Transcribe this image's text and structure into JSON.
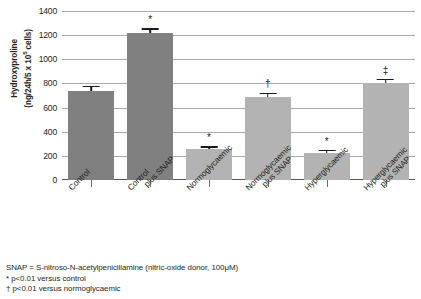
{
  "chart_data": {
    "type": "bar",
    "title": "",
    "xlabel": "",
    "ylabel": "Hydroxyproline (ng/24h/5 x 10⁵ cells)",
    "ylabel_line1": "Hydroxyproline",
    "ylabel_line2_pre": "(ng/24h/5 x 10",
    "ylabel_line2_sup": "5",
    "ylabel_line2_post": " cells)",
    "ylim": [
      0,
      1400
    ],
    "ytick_step": 200,
    "yticks": [
      "1400",
      "1200",
      "1000",
      "800",
      "600",
      "400",
      "200",
      "0"
    ],
    "ytick_values": [
      1400,
      1200,
      1000,
      800,
      600,
      400,
      200,
      0
    ],
    "grid": true,
    "legend": "none",
    "categories": [
      "Control",
      "Control plus SNAP",
      "Normoglycaemic",
      "Normoglycaemic plus SNAP",
      "Hyperglycaemic",
      "Hyperglycaemic plus SNAP"
    ],
    "category_lines": [
      [
        "Control",
        ""
      ],
      [
        "Control",
        "plus SNAP"
      ],
      [
        "Normoglycaemic",
        ""
      ],
      [
        "Normoglycaemic",
        "plus SNAP"
      ],
      [
        "Hyperglycaemic",
        ""
      ],
      [
        "Hyperglycaemic",
        "plus SNAP"
      ]
    ],
    "values": [
      735,
      1215,
      255,
      690,
      225,
      800
    ],
    "errors": [
      45,
      45,
      25,
      35,
      25,
      40
    ],
    "annotations": [
      "",
      "*",
      "*",
      "†",
      "*",
      "‡"
    ],
    "bar_colors": [
      "#808080",
      "#808080",
      "#b3b3b3",
      "#b3b3b3",
      "#b3b3b3",
      "#b3b3b3"
    ],
    "grid_color": "#a7a9ac",
    "axis_color": "#58595b"
  },
  "footnotes": {
    "line1": "SNAP = S-nitroso-N-acetylpenicillamine (nitric-oxide donor, 100μM)",
    "line2": "* p<0.01 versus control",
    "line3": "† p<0.01 versus normoglycaemic"
  }
}
